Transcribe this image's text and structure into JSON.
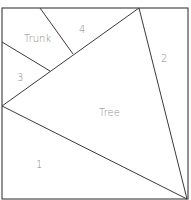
{
  "diagram": {
    "frame": {
      "x": 2,
      "y": 8,
      "width": 186,
      "height": 191
    },
    "colors": {
      "line": "#3a3a3a",
      "label": "#8a8a8a",
      "background": "#ffffff"
    },
    "segments": [
      {
        "id": "tree-left-top",
        "x1": 2,
        "y1": 106,
        "x2": 139,
        "y2": 8
      },
      {
        "id": "tree-right",
        "x1": 139,
        "y1": 8,
        "x2": 187,
        "y2": 199
      },
      {
        "id": "tree-bottom",
        "x1": 2,
        "y1": 106,
        "x2": 187,
        "y2": 199
      },
      {
        "id": "trunk-lower",
        "x1": 2,
        "y1": 42,
        "x2": 50,
        "y2": 71
      },
      {
        "id": "trunk-upper",
        "x1": 40,
        "y1": 8,
        "x2": 73,
        "y2": 54
      }
    ],
    "labels": [
      {
        "id": "label-trunk",
        "text": "Trunk",
        "x": 24,
        "y": 42
      },
      {
        "id": "label-4",
        "text": "4",
        "x": 79,
        "y": 33
      },
      {
        "id": "label-3",
        "text": "3",
        "x": 17,
        "y": 81
      },
      {
        "id": "label-2",
        "text": "2",
        "x": 161,
        "y": 62
      },
      {
        "id": "label-tree",
        "text": "Tree",
        "x": 99,
        "y": 116
      },
      {
        "id": "label-1",
        "text": "1",
        "x": 36,
        "y": 168
      }
    ]
  }
}
